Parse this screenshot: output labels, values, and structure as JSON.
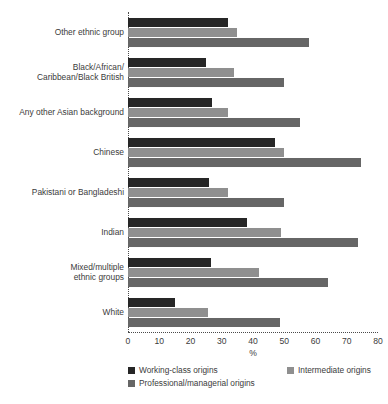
{
  "chart_data": {
    "type": "bar",
    "orientation": "horizontal",
    "title": "",
    "subtitle": "",
    "xlabel": "%",
    "ylabel": "",
    "xlim": [
      0,
      80
    ],
    "xticks": [
      0,
      10,
      20,
      30,
      40,
      50,
      60,
      70,
      80
    ],
    "xtick_labels": [
      "0",
      "10",
      "20",
      "30",
      "40",
      "50",
      "60",
      "70",
      "80"
    ],
    "grid": false,
    "legend_position": "bottom",
    "categories": [
      "Other ethnic group",
      "Black/African/\nCaribbean/Black British",
      "Any other Asian background",
      "Chinese",
      "Pakistani or Bangladeshi",
      "Indian",
      "Mixed/multiple\nethnic groups",
      "White"
    ],
    "series": [
      {
        "name": "Working-class origins",
        "color": "#262626",
        "values": [
          32,
          25,
          27,
          47,
          26,
          38,
          26.5,
          15
        ]
      },
      {
        "name": "Intermediate origins",
        "color": "#8f8f8f",
        "values": [
          35,
          34,
          32,
          50,
          32,
          49,
          42,
          25.5
        ]
      },
      {
        "name": "Professional/managerial origins",
        "color": "#666666",
        "values": [
          58,
          50,
          55,
          74.5,
          50,
          73.5,
          64,
          48.5
        ]
      }
    ]
  },
  "axis": {
    "x_title": "%"
  },
  "legend": {
    "items": [
      {
        "label": "Working-class origins",
        "color": "#262626"
      },
      {
        "label": "Intermediate origins",
        "color": "#8f8f8f"
      },
      {
        "label": "Professional/managerial origins",
        "color": "#666666"
      }
    ]
  }
}
